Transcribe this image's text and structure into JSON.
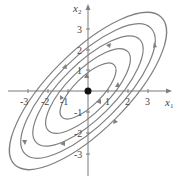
{
  "figure": {
    "type": "phase-portrait",
    "axes": {
      "x_label": "x",
      "x_sub": "1",
      "y_label": "x",
      "y_sub": "2",
      "x_ticks": [
        "-3",
        "-2",
        "-1",
        "1",
        "2",
        "3"
      ],
      "y_ticks": [
        "3",
        "2",
        "1",
        "-1",
        "-2",
        "-3"
      ]
    },
    "equilibrium": {
      "label": "origin",
      "x": 0,
      "y": 0,
      "style": "filled-dot"
    },
    "orbits": [
      {
        "rx": 0.7,
        "ry": 1.7
      },
      {
        "rx": 1.05,
        "ry": 2.6
      },
      {
        "rx": 1.35,
        "ry": 3.4
      },
      {
        "rx": 1.6,
        "ry": 4.1
      },
      {
        "rx": 1.85,
        "ry": 4.8
      }
    ],
    "colors": {
      "curve": "#808080",
      "axis": "#7a7a7a",
      "dot": "#111111"
    }
  }
}
